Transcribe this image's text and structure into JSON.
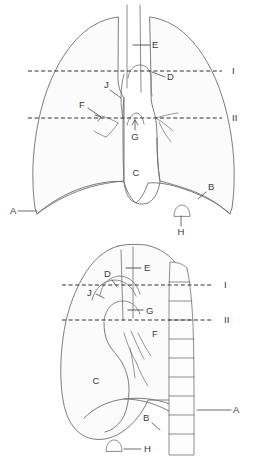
{
  "figure": {
    "colors": {
      "background": "#ffffff",
      "outline": "#6e6e6e",
      "lung_fill": "#fbfbfb",
      "label_text": "#3a3a3a",
      "level_line": "#2f2f2f"
    }
  },
  "panels": [
    {
      "id": "frontal",
      "name": "frontal-chest-view",
      "labels": [
        {
          "key": "A",
          "text": "A",
          "x": 10,
          "y": 214,
          "anchor": "start",
          "target": "lateral-costophrenic-angle"
        },
        {
          "key": "B",
          "text": "B",
          "x": 208,
          "y": 190,
          "anchor": "start",
          "target": "diaphragm-dome"
        },
        {
          "key": "C",
          "text": "C",
          "x": 136,
          "y": 176,
          "anchor": "middle",
          "target": "cardiac-shadow"
        },
        {
          "key": "D",
          "text": "D",
          "x": 167,
          "y": 80,
          "anchor": "start",
          "target": "aortic-arch"
        },
        {
          "key": "E",
          "text": "E",
          "x": 152,
          "y": 48,
          "anchor": "start",
          "target": "trachea"
        },
        {
          "key": "F",
          "text": "F",
          "x": 79,
          "y": 108,
          "anchor": "start",
          "target": "hilum-left"
        },
        {
          "key": "G",
          "text": "G",
          "x": 135,
          "y": 135,
          "anchor": "middle",
          "target": "pulmonary-trunk"
        },
        {
          "key": "H",
          "text": "H",
          "x": 181,
          "y": 232,
          "anchor": "middle",
          "target": "gastric-air-bubble"
        },
        {
          "key": "J",
          "text": "J",
          "x": 106,
          "y": 88,
          "anchor": "start",
          "target": "superior-vena-cava"
        }
      ],
      "levels": [
        {
          "key": "I",
          "text": "I",
          "x": 232,
          "y": 74,
          "line_y": 71,
          "x1": 28,
          "x2": 222
        },
        {
          "key": "II",
          "text": "II",
          "x": 232,
          "y": 121,
          "line_y": 118,
          "x1": 28,
          "x2": 222
        }
      ]
    },
    {
      "id": "lateral",
      "name": "lateral-chest-view",
      "labels": [
        {
          "key": "A",
          "text": "A",
          "x": 233,
          "y": 413,
          "anchor": "start",
          "target": "thoracic-vertebral-column"
        },
        {
          "key": "B",
          "text": "B",
          "x": 143,
          "y": 421,
          "anchor": "start",
          "target": "diaphragm-dome"
        },
        {
          "key": "C",
          "text": "C",
          "x": 96,
          "y": 384,
          "anchor": "middle",
          "target": "cardiac-shadow"
        },
        {
          "key": "D",
          "text": "D",
          "x": 107,
          "y": 277,
          "anchor": "start",
          "target": "aortic-arch"
        },
        {
          "key": "E",
          "text": "E",
          "x": 142,
          "y": 271,
          "anchor": "start",
          "target": "trachea"
        },
        {
          "key": "F",
          "text": "F",
          "x": 152,
          "y": 337,
          "anchor": "start",
          "target": "hilar-vessels"
        },
        {
          "key": "G",
          "text": "G",
          "x": 145,
          "y": 313,
          "anchor": "start",
          "target": "pulmonary-trunk"
        },
        {
          "key": "H",
          "text": "H",
          "x": 144,
          "y": 452,
          "anchor": "start",
          "target": "gastric-air-bubble"
        },
        {
          "key": "J",
          "text": "J",
          "x": 89,
          "y": 296,
          "anchor": "start",
          "target": "superior-vena-cava"
        }
      ],
      "levels": [
        {
          "key": "I",
          "text": "I",
          "x": 224,
          "y": 288,
          "line_y": 285,
          "x1": 62,
          "x2": 214
        },
        {
          "key": "II",
          "text": "II",
          "x": 224,
          "y": 323,
          "line_y": 320,
          "x1": 62,
          "x2": 214
        }
      ]
    }
  ]
}
